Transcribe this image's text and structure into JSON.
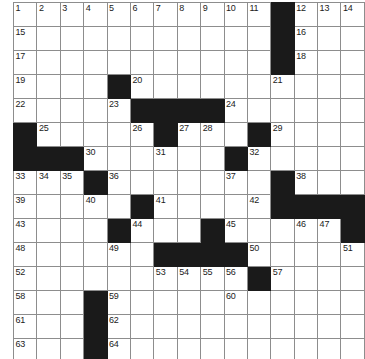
{
  "puzzle": {
    "title": "Crossword Grid",
    "rows": 15,
    "cols": 15,
    "cell_size_px": 23,
    "colors": {
      "block": "#1a1a1a",
      "cell": "#ffffff",
      "grid_line": "#8d8d8d",
      "outer_border": "#141414",
      "number_text": "#1b1b1b"
    },
    "max_clue_number": 64,
    "grid": [
      [
        {
          "type": "cell",
          "number": "1"
        },
        {
          "type": "cell",
          "number": "2"
        },
        {
          "type": "cell",
          "number": "3"
        },
        {
          "type": "cell",
          "number": "4"
        },
        {
          "type": "cell",
          "number": "5"
        },
        {
          "type": "cell",
          "number": "6"
        },
        {
          "type": "cell",
          "number": "7"
        },
        {
          "type": "cell",
          "number": "8"
        },
        {
          "type": "cell",
          "number": "9"
        },
        {
          "type": "cell",
          "number": "10"
        },
        {
          "type": "cell",
          "number": "11"
        },
        {
          "type": "block",
          "number": ""
        },
        {
          "type": "cell",
          "number": "12"
        },
        {
          "type": "cell",
          "number": "13"
        },
        {
          "type": "cell",
          "number": "14"
        }
      ],
      [
        {
          "type": "cell",
          "number": "15"
        },
        {
          "type": "cell",
          "number": ""
        },
        {
          "type": "cell",
          "number": ""
        },
        {
          "type": "cell",
          "number": ""
        },
        {
          "type": "cell",
          "number": ""
        },
        {
          "type": "cell",
          "number": ""
        },
        {
          "type": "cell",
          "number": ""
        },
        {
          "type": "cell",
          "number": ""
        },
        {
          "type": "cell",
          "number": ""
        },
        {
          "type": "cell",
          "number": ""
        },
        {
          "type": "cell",
          "number": ""
        },
        {
          "type": "block",
          "number": ""
        },
        {
          "type": "cell",
          "number": "16"
        },
        {
          "type": "cell",
          "number": ""
        },
        {
          "type": "cell",
          "number": ""
        }
      ],
      [
        {
          "type": "cell",
          "number": "17"
        },
        {
          "type": "cell",
          "number": ""
        },
        {
          "type": "cell",
          "number": ""
        },
        {
          "type": "cell",
          "number": ""
        },
        {
          "type": "cell",
          "number": ""
        },
        {
          "type": "cell",
          "number": ""
        },
        {
          "type": "cell",
          "number": ""
        },
        {
          "type": "cell",
          "number": ""
        },
        {
          "type": "cell",
          "number": ""
        },
        {
          "type": "cell",
          "number": ""
        },
        {
          "type": "cell",
          "number": ""
        },
        {
          "type": "block",
          "number": ""
        },
        {
          "type": "cell",
          "number": "18"
        },
        {
          "type": "cell",
          "number": ""
        },
        {
          "type": "cell",
          "number": ""
        }
      ],
      [
        {
          "type": "cell",
          "number": "19"
        },
        {
          "type": "cell",
          "number": ""
        },
        {
          "type": "cell",
          "number": ""
        },
        {
          "type": "cell",
          "number": ""
        },
        {
          "type": "block",
          "number": ""
        },
        {
          "type": "cell",
          "number": "20"
        },
        {
          "type": "cell",
          "number": ""
        },
        {
          "type": "cell",
          "number": ""
        },
        {
          "type": "cell",
          "number": ""
        },
        {
          "type": "cell",
          "number": ""
        },
        {
          "type": "cell",
          "number": ""
        },
        {
          "type": "cell",
          "number": "21"
        },
        {
          "type": "cell",
          "number": ""
        },
        {
          "type": "cell",
          "number": ""
        },
        {
          "type": "cell",
          "number": ""
        }
      ],
      [
        {
          "type": "cell",
          "number": "22"
        },
        {
          "type": "cell",
          "number": ""
        },
        {
          "type": "cell",
          "number": ""
        },
        {
          "type": "cell",
          "number": ""
        },
        {
          "type": "cell",
          "number": "23"
        },
        {
          "type": "block",
          "number": ""
        },
        {
          "type": "block",
          "number": ""
        },
        {
          "type": "block",
          "number": ""
        },
        {
          "type": "block",
          "number": ""
        },
        {
          "type": "cell",
          "number": "24"
        },
        {
          "type": "cell",
          "number": ""
        },
        {
          "type": "cell",
          "number": ""
        },
        {
          "type": "cell",
          "number": ""
        },
        {
          "type": "cell",
          "number": ""
        },
        {
          "type": "cell",
          "number": ""
        }
      ],
      [
        {
          "type": "block",
          "number": ""
        },
        {
          "type": "cell",
          "number": "25"
        },
        {
          "type": "cell",
          "number": ""
        },
        {
          "type": "cell",
          "number": ""
        },
        {
          "type": "cell",
          "number": ""
        },
        {
          "type": "cell",
          "number": "26"
        },
        {
          "type": "block",
          "number": ""
        },
        {
          "type": "cell",
          "number": "27"
        },
        {
          "type": "cell",
          "number": "28"
        },
        {
          "type": "cell",
          "number": ""
        },
        {
          "type": "block",
          "number": ""
        },
        {
          "type": "cell",
          "number": "29"
        },
        {
          "type": "cell",
          "number": ""
        },
        {
          "type": "cell",
          "number": ""
        },
        {
          "type": "cell",
          "number": ""
        }
      ],
      [
        {
          "type": "block",
          "number": ""
        },
        {
          "type": "block",
          "number": ""
        },
        {
          "type": "block",
          "number": ""
        },
        {
          "type": "cell",
          "number": "30"
        },
        {
          "type": "cell",
          "number": ""
        },
        {
          "type": "cell",
          "number": ""
        },
        {
          "type": "cell",
          "number": "31"
        },
        {
          "type": "cell",
          "number": ""
        },
        {
          "type": "cell",
          "number": ""
        },
        {
          "type": "block",
          "number": ""
        },
        {
          "type": "cell",
          "number": "32"
        },
        {
          "type": "cell",
          "number": ""
        },
        {
          "type": "cell",
          "number": ""
        },
        {
          "type": "cell",
          "number": ""
        },
        {
          "type": "cell",
          "number": ""
        }
      ],
      [
        {
          "type": "cell",
          "number": "33"
        },
        {
          "type": "cell",
          "number": "34"
        },
        {
          "type": "cell",
          "number": "35"
        },
        {
          "type": "block",
          "number": ""
        },
        {
          "type": "cell",
          "number": "36"
        },
        {
          "type": "cell",
          "number": ""
        },
        {
          "type": "cell",
          "number": ""
        },
        {
          "type": "cell",
          "number": ""
        },
        {
          "type": "cell",
          "number": ""
        },
        {
          "type": "cell",
          "number": "37"
        },
        {
          "type": "cell",
          "number": ""
        },
        {
          "type": "block",
          "number": ""
        },
        {
          "type": "cell",
          "number": "38"
        },
        {
          "type": "cell",
          "number": ""
        },
        {
          "type": "cell",
          "number": ""
        }
      ],
      [
        {
          "type": "cell",
          "number": "39"
        },
        {
          "type": "cell",
          "number": ""
        },
        {
          "type": "cell",
          "number": ""
        },
        {
          "type": "cell",
          "number": "40"
        },
        {
          "type": "cell",
          "number": ""
        },
        {
          "type": "block",
          "number": ""
        },
        {
          "type": "cell",
          "number": "41"
        },
        {
          "type": "cell",
          "number": ""
        },
        {
          "type": "cell",
          "number": ""
        },
        {
          "type": "cell",
          "number": ""
        },
        {
          "type": "cell",
          "number": "42"
        },
        {
          "type": "block",
          "number": ""
        },
        {
          "type": "block",
          "number": ""
        },
        {
          "type": "block",
          "number": ""
        },
        {
          "type": "block",
          "number": ""
        }
      ],
      [
        {
          "type": "cell",
          "number": "43"
        },
        {
          "type": "cell",
          "number": ""
        },
        {
          "type": "cell",
          "number": ""
        },
        {
          "type": "cell",
          "number": ""
        },
        {
          "type": "block",
          "number": ""
        },
        {
          "type": "cell",
          "number": "44"
        },
        {
          "type": "cell",
          "number": ""
        },
        {
          "type": "cell",
          "number": ""
        },
        {
          "type": "block",
          "number": ""
        },
        {
          "type": "cell",
          "number": "45"
        },
        {
          "type": "cell",
          "number": ""
        },
        {
          "type": "cell",
          "number": ""
        },
        {
          "type": "cell",
          "number": "46"
        },
        {
          "type": "cell",
          "number": "47"
        },
        {
          "type": "block",
          "number": ""
        }
      ],
      [
        {
          "type": "cell",
          "number": "48"
        },
        {
          "type": "cell",
          "number": ""
        },
        {
          "type": "cell",
          "number": ""
        },
        {
          "type": "cell",
          "number": ""
        },
        {
          "type": "cell",
          "number": "49"
        },
        {
          "type": "cell",
          "number": ""
        },
        {
          "type": "block",
          "number": ""
        },
        {
          "type": "block",
          "number": ""
        },
        {
          "type": "block",
          "number": ""
        },
        {
          "type": "block",
          "number": ""
        },
        {
          "type": "cell",
          "number": "50"
        },
        {
          "type": "cell",
          "number": ""
        },
        {
          "type": "cell",
          "number": ""
        },
        {
          "type": "cell",
          "number": ""
        },
        {
          "type": "cell",
          "number": "51"
        }
      ],
      [
        {
          "type": "cell",
          "number": "52"
        },
        {
          "type": "cell",
          "number": ""
        },
        {
          "type": "cell",
          "number": ""
        },
        {
          "type": "cell",
          "number": ""
        },
        {
          "type": "cell",
          "number": ""
        },
        {
          "type": "cell",
          "number": ""
        },
        {
          "type": "cell",
          "number": "53"
        },
        {
          "type": "cell",
          "number": "54"
        },
        {
          "type": "cell",
          "number": "55"
        },
        {
          "type": "cell",
          "number": "56"
        },
        {
          "type": "block",
          "number": ""
        },
        {
          "type": "cell",
          "number": "57"
        },
        {
          "type": "cell",
          "number": ""
        },
        {
          "type": "cell",
          "number": ""
        },
        {
          "type": "cell",
          "number": ""
        }
      ],
      [
        {
          "type": "cell",
          "number": "58"
        },
        {
          "type": "cell",
          "number": ""
        },
        {
          "type": "cell",
          "number": ""
        },
        {
          "type": "block",
          "number": ""
        },
        {
          "type": "cell",
          "number": "59"
        },
        {
          "type": "cell",
          "number": ""
        },
        {
          "type": "cell",
          "number": ""
        },
        {
          "type": "cell",
          "number": ""
        },
        {
          "type": "cell",
          "number": ""
        },
        {
          "type": "cell",
          "number": "60"
        },
        {
          "type": "cell",
          "number": ""
        },
        {
          "type": "cell",
          "number": ""
        },
        {
          "type": "cell",
          "number": ""
        },
        {
          "type": "cell",
          "number": ""
        },
        {
          "type": "cell",
          "number": ""
        }
      ],
      [
        {
          "type": "cell",
          "number": "61"
        },
        {
          "type": "cell",
          "number": ""
        },
        {
          "type": "cell",
          "number": ""
        },
        {
          "type": "block",
          "number": ""
        },
        {
          "type": "cell",
          "number": "62"
        },
        {
          "type": "cell",
          "number": ""
        },
        {
          "type": "cell",
          "number": ""
        },
        {
          "type": "cell",
          "number": ""
        },
        {
          "type": "cell",
          "number": ""
        },
        {
          "type": "cell",
          "number": ""
        },
        {
          "type": "cell",
          "number": ""
        },
        {
          "type": "cell",
          "number": ""
        },
        {
          "type": "cell",
          "number": ""
        },
        {
          "type": "cell",
          "number": ""
        },
        {
          "type": "cell",
          "number": ""
        }
      ],
      [
        {
          "type": "cell",
          "number": "63"
        },
        {
          "type": "cell",
          "number": ""
        },
        {
          "type": "cell",
          "number": ""
        },
        {
          "type": "block",
          "number": ""
        },
        {
          "type": "cell",
          "number": "64"
        },
        {
          "type": "cell",
          "number": ""
        },
        {
          "type": "cell",
          "number": ""
        },
        {
          "type": "cell",
          "number": ""
        },
        {
          "type": "cell",
          "number": ""
        },
        {
          "type": "cell",
          "number": ""
        },
        {
          "type": "cell",
          "number": ""
        },
        {
          "type": "cell",
          "number": ""
        },
        {
          "type": "cell",
          "number": ""
        },
        {
          "type": "cell",
          "number": ""
        },
        {
          "type": "cell",
          "number": ""
        }
      ]
    ]
  }
}
